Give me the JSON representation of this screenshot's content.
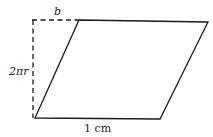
{
  "diagram": {
    "shape": "parallelogram",
    "labels": {
      "top_offset": "b",
      "height": "2πr",
      "base": "1 cm"
    },
    "colors": {
      "stroke": "#1a1a1a",
      "background": "#ffffff"
    }
  }
}
